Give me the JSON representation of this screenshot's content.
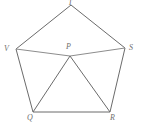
{
  "figure": {
    "background_color": "#ffffff",
    "stroke_color": "#6b6b6b",
    "label_color": "#6f6f6f",
    "width": 141,
    "height": 130,
    "vertices": [
      {
        "id": "T",
        "label": "T",
        "x": 71,
        "y": 5,
        "label_x": 68,
        "label_y": -1
      },
      {
        "id": "V",
        "label": "V",
        "x": 16,
        "y": 49,
        "label_x": 4,
        "label_y": 45
      },
      {
        "id": "S",
        "label": "S",
        "x": 125,
        "y": 48,
        "label_x": 129,
        "label_y": 44
      },
      {
        "id": "Q",
        "label": "Q",
        "x": 33,
        "y": 112,
        "label_x": 27,
        "label_y": 114
      },
      {
        "id": "R",
        "label": "R",
        "x": 110,
        "y": 112,
        "label_x": 110,
        "label_y": 114
      },
      {
        "id": "P",
        "label": "P",
        "x": 70,
        "y": 56,
        "label_x": 66,
        "label_y": 43
      }
    ],
    "edges": [
      {
        "name": "edge-T-V",
        "from": "T",
        "to": "V"
      },
      {
        "name": "edge-T-S",
        "from": "T",
        "to": "S"
      },
      {
        "name": "edge-V-Q",
        "from": "V",
        "to": "Q"
      },
      {
        "name": "edge-S-R",
        "from": "S",
        "to": "R"
      },
      {
        "name": "edge-Q-R",
        "from": "Q",
        "to": "R"
      },
      {
        "name": "edge-V-P",
        "from": "V",
        "to": "P"
      },
      {
        "name": "edge-P-S",
        "from": "P",
        "to": "S"
      },
      {
        "name": "edge-P-Q",
        "from": "P",
        "to": "Q"
      },
      {
        "name": "edge-P-R",
        "from": "P",
        "to": "R"
      }
    ]
  }
}
